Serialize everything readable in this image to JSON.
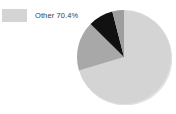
{
  "canvas": {
    "width": 176,
    "height": 114,
    "background": "#ffffff"
  },
  "legend": {
    "position": "top-left",
    "entries": [
      {
        "label": "Other 70.4%",
        "name": "Other",
        "value": 70.4,
        "color": "#d4d4d4"
      }
    ]
  },
  "pie": {
    "center_x": 48,
    "center_y": 48,
    "radius": 47,
    "start_angle_deg": -90,
    "shadow_color": "#e0e0e0"
  },
  "chart_data": {
    "type": "pie",
    "title": "",
    "subtitle": "",
    "legend_position": "top-left",
    "labels": [
      "Other",
      "Segment 2",
      "Segment 3",
      "Segment 4"
    ],
    "values": [
      70.4,
      17.0,
      8.6,
      4.0
    ],
    "display_labels": [
      "Other 70.4%",
      "",
      "",
      ""
    ],
    "colors": [
      "#d4d4d4",
      "#a8a8a8",
      "#111111",
      "#9e9e9e"
    ],
    "annotations": [
      "Other 70.4%"
    ],
    "grid": false,
    "total": 100
  }
}
